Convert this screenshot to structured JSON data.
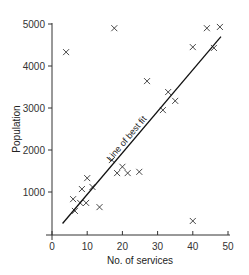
{
  "chart_data": {
    "type": "scatter",
    "title": "",
    "xlabel": "No. of services",
    "ylabel": "Population",
    "xlim": [
      0,
      50
    ],
    "ylim": [
      0,
      5000
    ],
    "xticks": [
      0,
      10,
      20,
      30,
      40,
      50
    ],
    "yticks": [
      1000,
      2000,
      3000,
      4000,
      5000
    ],
    "grid": false,
    "marker": "x",
    "points": [
      {
        "x": 4,
        "y": 4330
      },
      {
        "x": 6,
        "y": 830
      },
      {
        "x": 6.5,
        "y": 550
      },
      {
        "x": 8,
        "y": 740
      },
      {
        "x": 8.5,
        "y": 1070
      },
      {
        "x": 9.7,
        "y": 740
      },
      {
        "x": 10,
        "y": 1330
      },
      {
        "x": 11.5,
        "y": 1120
      },
      {
        "x": 13.5,
        "y": 640
      },
      {
        "x": 17,
        "y": 1760
      },
      {
        "x": 17.7,
        "y": 4900
      },
      {
        "x": 18.5,
        "y": 1450
      },
      {
        "x": 20,
        "y": 1600
      },
      {
        "x": 21.5,
        "y": 1450
      },
      {
        "x": 24.8,
        "y": 1480
      },
      {
        "x": 27,
        "y": 3640
      },
      {
        "x": 31.5,
        "y": 2950
      },
      {
        "x": 33,
        "y": 3380
      },
      {
        "x": 35,
        "y": 3170
      },
      {
        "x": 40,
        "y": 310
      },
      {
        "x": 40,
        "y": 4450
      },
      {
        "x": 44,
        "y": 4900
      },
      {
        "x": 46,
        "y": 4430
      },
      {
        "x": 47.7,
        "y": 4930
      }
    ],
    "trendline": {
      "label": "Line of best fit",
      "x0": 3,
      "y0": 250,
      "x1": 48,
      "y1": 4700
    }
  }
}
